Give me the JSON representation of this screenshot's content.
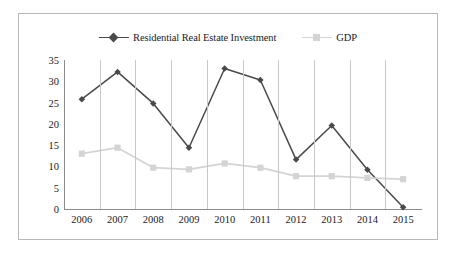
{
  "chart_data": {
    "type": "line",
    "title": "",
    "xlabel": "",
    "ylabel": "",
    "categories": [
      "2006",
      "2007",
      "2008",
      "2009",
      "2010",
      "2011",
      "2012",
      "2013",
      "2014",
      "2015"
    ],
    "yticks": [
      0,
      5,
      10,
      15,
      20,
      25,
      30,
      35
    ],
    "ylim": [
      0,
      35
    ],
    "grid": "vertical",
    "legend_position": "top-center",
    "series": [
      {
        "name": "Residential Real Estate Investment",
        "color": "#4a4a4a",
        "marker": "diamond",
        "values": [
          25.8,
          32.2,
          24.8,
          14.4,
          33.0,
          30.3,
          11.6,
          19.6,
          9.2,
          0.4
        ]
      },
      {
        "name": "GDP",
        "color": "#d4d4d4",
        "marker": "square",
        "values": [
          13.0,
          14.4,
          9.7,
          9.3,
          10.7,
          9.7,
          7.7,
          7.7,
          7.3,
          7.0
        ]
      }
    ]
  },
  "legend": {
    "entries": [
      {
        "label": "Residential Real Estate Investment"
      },
      {
        "label": "GDP"
      }
    ]
  },
  "colors": {
    "series_dark": "#4a4a4a",
    "series_light": "#d4d4d4",
    "gridline": "#c8c8c8",
    "axis": "#8c8c8c",
    "border": "#b9b9b9",
    "text": "#1a1a1a"
  }
}
